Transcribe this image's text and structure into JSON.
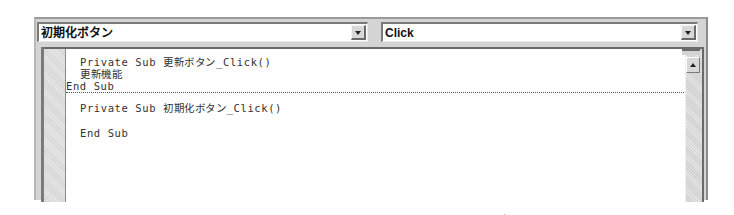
{
  "toolbar": {
    "object_combo": {
      "value": "初期化ボタン",
      "icon": "chevron-down-icon"
    },
    "procedure_combo": {
      "value": "Click",
      "icon": "chevron-down-icon"
    }
  },
  "code": {
    "procedures": [
      {
        "lines": [
          "Private Sub 更新ボタン_Click()",
          "更新機能",
          "End Sub"
        ]
      },
      {
        "lines": [
          "Private Sub 初期化ボタン_Click()",
          "",
          "End Sub"
        ]
      }
    ]
  },
  "scrollbar": {
    "up_icon": "arrow-up-icon"
  }
}
